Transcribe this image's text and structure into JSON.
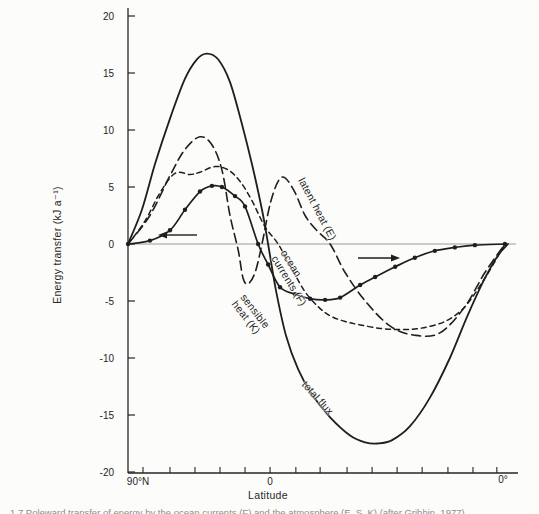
{
  "figure": {
    "caption_fragment": "1.7  Poleward transfer of energy by the ocean currents (F) and the atmosphere (E, S, K) (after Gribbin, 1977)"
  },
  "chart_data": {
    "type": "line",
    "title": "",
    "xlabel": "Latitude",
    "ylabel": "Energy transfer (kJ a⁻¹)",
    "ylim": [
      -20,
      20
    ],
    "y_ticks": [
      20,
      15,
      10,
      5,
      0,
      -5,
      -10,
      -15,
      -20
    ],
    "x_axis": {
      "left_label": "90°N",
      "center_label": "0",
      "right_label": "0°",
      "minor_tick_positions": [
        3.9,
        10.9,
        17.4,
        23.9,
        30.4,
        36.9,
        43.6,
        49.9,
        56.9,
        63.4,
        69.9,
        76.4,
        83.1,
        89.6,
        95.8
      ]
    },
    "grid": false,
    "zero_line": true,
    "legend_position": "inline-rotated-labels",
    "ink_color": "#1e1e1e",
    "series": [
      {
        "name": "total flux",
        "style": "solid",
        "marker": "none",
        "points": [
          [
            0,
            0
          ],
          [
            3.6,
            3
          ],
          [
            7,
            7
          ],
          [
            10.9,
            11
          ],
          [
            14.8,
            14.5
          ],
          [
            17.9,
            16.2
          ],
          [
            20.5,
            16.7
          ],
          [
            23.4,
            16.2
          ],
          [
            26.5,
            14.2
          ],
          [
            29.6,
            10.5
          ],
          [
            32.2,
            7
          ],
          [
            34.8,
            3
          ],
          [
            36.4,
            0
          ],
          [
            38.4,
            -4
          ],
          [
            41,
            -8
          ],
          [
            44.2,
            -11
          ],
          [
            47.8,
            -13.2
          ],
          [
            52.5,
            -15.2
          ],
          [
            57.7,
            -16.8
          ],
          [
            61.6,
            -17.4
          ],
          [
            64.9,
            -17.5
          ],
          [
            68.6,
            -17.2
          ],
          [
            73.2,
            -16
          ],
          [
            78.4,
            -13.5
          ],
          [
            83.6,
            -10
          ],
          [
            88.3,
            -6.2
          ],
          [
            92.7,
            -3
          ],
          [
            96.1,
            -1
          ],
          [
            98.7,
            0
          ]
        ]
      },
      {
        "name": "latent heat (E)",
        "style": "long-dash",
        "marker": "none",
        "points": [
          [
            0,
            0
          ],
          [
            5.7,
            2.5
          ],
          [
            10.9,
            6
          ],
          [
            14.8,
            8.3
          ],
          [
            18.7,
            9.4
          ],
          [
            21.8,
            8.7
          ],
          [
            24.4,
            6.5
          ],
          [
            26.5,
            2.5
          ],
          [
            28.6,
            -0.5
          ],
          [
            29.9,
            -3
          ],
          [
            31.2,
            -3.5
          ],
          [
            33,
            -2.5
          ],
          [
            34.8,
            0
          ],
          [
            36.9,
            3.5
          ],
          [
            39,
            5.5
          ],
          [
            40.8,
            5.8
          ],
          [
            43.4,
            4.5
          ],
          [
            46,
            2.5
          ],
          [
            49,
            1.2
          ],
          [
            52.5,
            0
          ],
          [
            56.4,
            -2.5
          ],
          [
            61.6,
            -5
          ],
          [
            68.1,
            -7.2
          ],
          [
            74.5,
            -8
          ],
          [
            81,
            -7.8
          ],
          [
            87.5,
            -5.5
          ],
          [
            92.7,
            -2.5
          ],
          [
            97.9,
            0
          ]
        ]
      },
      {
        "name": "sensible heat (K)",
        "style": "short-dash",
        "marker": "none",
        "points": [
          [
            0,
            0
          ],
          [
            4.4,
            2
          ],
          [
            8.3,
            4.5
          ],
          [
            12.2,
            6.2
          ],
          [
            16.1,
            6.1
          ],
          [
            18.7,
            6.3
          ],
          [
            22.6,
            6.8
          ],
          [
            26,
            6.5
          ],
          [
            29.1,
            5.5
          ],
          [
            32.2,
            3.8
          ],
          [
            35.6,
            1.5
          ],
          [
            39,
            0
          ],
          [
            42.6,
            -2.2
          ],
          [
            46,
            -4.2
          ],
          [
            49.4,
            -5.5
          ],
          [
            52.5,
            -6.3
          ],
          [
            56.4,
            -6.8
          ],
          [
            60.3,
            -7.1
          ],
          [
            65.5,
            -7.4
          ],
          [
            70.6,
            -7.5
          ],
          [
            75.8,
            -7.4
          ],
          [
            82.3,
            -6.8
          ],
          [
            87.5,
            -5.5
          ],
          [
            92.7,
            -3
          ],
          [
            97.9,
            0
          ]
        ]
      },
      {
        "name": "ocean currents (F)",
        "style": "solid",
        "marker": "dot",
        "points": [
          [
            0,
            0
          ],
          [
            5.7,
            0.3
          ],
          [
            10.9,
            1.2
          ],
          [
            14.8,
            3
          ],
          [
            18.7,
            4.6
          ],
          [
            21.8,
            5.1
          ],
          [
            24.4,
            5
          ],
          [
            27.8,
            4.2
          ],
          [
            30.4,
            3.3
          ],
          [
            33.8,
            0
          ],
          [
            36.4,
            -1.8
          ],
          [
            39.5,
            -3.8
          ],
          [
            43.4,
            -4.4
          ],
          [
            47.3,
            -4.8
          ],
          [
            51.2,
            -4.9
          ],
          [
            55.1,
            -4.7
          ],
          [
            60.3,
            -3.6
          ],
          [
            64.2,
            -2.9
          ],
          [
            69.4,
            -2
          ],
          [
            74.5,
            -1.2
          ],
          [
            79.7,
            -0.6
          ],
          [
            84.9,
            -0.3
          ],
          [
            90.1,
            -0.1
          ],
          [
            97.9,
            0
          ]
        ]
      }
    ],
    "annotations": [
      {
        "id": "latent",
        "text": "latent heat (E)",
        "x": 306,
        "y": 176,
        "rotation": 62
      },
      {
        "id": "ocean",
        "text": "ocean\ncurrents (F)",
        "x": 288,
        "y": 248,
        "rotation": 58
      },
      {
        "id": "sensible",
        "text": "sensible\nheat (K)",
        "x": 247,
        "y": 292,
        "rotation": 52
      },
      {
        "id": "total",
        "text": "total flux",
        "x": 308,
        "y": 379,
        "rotation": 48
      }
    ],
    "arrows": [
      {
        "direction": "left",
        "x_from": 197,
        "x_to": 158,
        "y": 235
      },
      {
        "direction": "right",
        "x_from": 358,
        "x_to": 400,
        "y": 258
      }
    ]
  }
}
